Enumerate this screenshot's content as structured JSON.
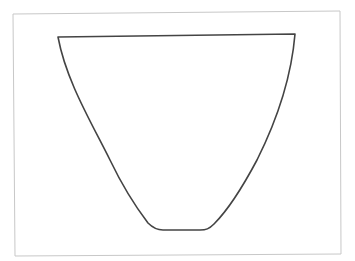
{
  "figure": {
    "background": "#ffffff",
    "frame": {
      "stroke": "#c8c8c8",
      "stroke_width": 1,
      "corners": [
        [
          13,
          14
        ],
        [
          340,
          11
        ],
        [
          341,
          254
        ],
        [
          15,
          256
        ]
      ]
    },
    "shape": {
      "description": "cup / inverted trapezoid outline with curved sides and rounded flat base",
      "stroke": "#444444",
      "stroke_width": 1.6,
      "top_edge": [
        [
          58,
          37
        ],
        [
          295,
          34
        ]
      ],
      "left_side_points": [
        [
          58,
          37
        ],
        [
          63,
          60
        ],
        [
          82,
          110
        ],
        [
          110,
          160
        ],
        [
          140,
          208
        ],
        [
          160,
          230
        ]
      ],
      "right_side_points": [
        [
          295,
          34
        ],
        [
          291,
          60
        ],
        [
          282,
          110
        ],
        [
          257,
          160
        ],
        [
          219,
          208
        ],
        [
          203,
          230
        ]
      ],
      "base": [
        [
          160,
          230
        ],
        [
          203,
          230
        ]
      ]
    }
  }
}
